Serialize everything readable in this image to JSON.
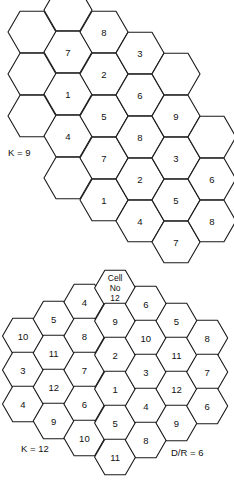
{
  "figure": {
    "background": "#ffffff",
    "stroke_color": "#1a1a1a",
    "text_color": "#111111"
  },
  "top_pattern": {
    "label": "K = 9",
    "label_pos": {
      "x": 8,
      "y": 147
    },
    "hex_radius": 24,
    "origin": {
      "x": 32,
      "y": 32
    },
    "col_spacing": 36,
    "row_spacing": 42,
    "cells": [
      {
        "col": 0,
        "y": 32,
        "text": ""
      },
      {
        "col": 0,
        "y": 74,
        "text": ""
      },
      {
        "col": 0,
        "y": 116,
        "text": ""
      },
      {
        "col": 1,
        "y": 10,
        "text": ""
      },
      {
        "col": 1,
        "y": 52,
        "text": "7"
      },
      {
        "col": 1,
        "y": 94,
        "text": "1"
      },
      {
        "col": 1,
        "y": 136,
        "text": "4"
      },
      {
        "col": 1,
        "y": 178,
        "text": ""
      },
      {
        "col": 2,
        "y": 32,
        "text": "8"
      },
      {
        "col": 2,
        "y": 74,
        "text": "2"
      },
      {
        "col": 2,
        "y": 116,
        "text": "5"
      },
      {
        "col": 2,
        "y": 158,
        "text": "7"
      },
      {
        "col": 2,
        "y": 200,
        "text": "1"
      },
      {
        "col": 3,
        "y": 53,
        "text": "3"
      },
      {
        "col": 3,
        "y": 95,
        "text": "6"
      },
      {
        "col": 3,
        "y": 137,
        "text": "8"
      },
      {
        "col": 3,
        "y": 179,
        "text": "2"
      },
      {
        "col": 3,
        "y": 221,
        "text": "4"
      },
      {
        "col": 4,
        "y": 74,
        "text": ""
      },
      {
        "col": 4,
        "y": 116,
        "text": "9"
      },
      {
        "col": 4,
        "y": 158,
        "text": "3"
      },
      {
        "col": 4,
        "y": 200,
        "text": "5"
      },
      {
        "col": 4,
        "y": 242,
        "text": "7"
      },
      {
        "col": 5,
        "y": 137,
        "text": ""
      },
      {
        "col": 5,
        "y": 179,
        "text": "6"
      },
      {
        "col": 5,
        "y": 221,
        "text": "8"
      }
    ]
  },
  "bottom_pattern": {
    "label": "K = 12",
    "label_pos": {
      "x": 21,
      "y": 443
    },
    "ratio_label": "D/R = 6",
    "ratio_label_pos": {
      "x": 171,
      "y": 447
    },
    "hex_radius": 20.5,
    "origin": {
      "x": 23,
      "y": 0
    },
    "col_spacing": 30.7,
    "cells": [
      {
        "col": 0,
        "y": 336,
        "text": "10"
      },
      {
        "col": 0,
        "y": 370,
        "text": "3"
      },
      {
        "col": 0,
        "y": 404,
        "text": "4"
      },
      {
        "col": 1,
        "y": 319,
        "text": "5"
      },
      {
        "col": 1,
        "y": 353,
        "text": "11"
      },
      {
        "col": 1,
        "y": 387,
        "text": "12"
      },
      {
        "col": 1,
        "y": 421,
        "text": "9"
      },
      {
        "col": 2,
        "y": 302,
        "text": "4"
      },
      {
        "col": 2,
        "y": 336,
        "text": "8"
      },
      {
        "col": 2,
        "y": 370,
        "text": "7"
      },
      {
        "col": 2,
        "y": 404,
        "text": "6"
      },
      {
        "col": 2,
        "y": 438,
        "text": "10"
      },
      {
        "col": 3,
        "y": 288,
        "text": "Cell|No|12"
      },
      {
        "col": 3,
        "y": 321,
        "text": "9"
      },
      {
        "col": 3,
        "y": 355,
        "text": "2"
      },
      {
        "col": 3,
        "y": 389,
        "text": "1"
      },
      {
        "col": 3,
        "y": 423,
        "text": "5"
      },
      {
        "col": 3,
        "y": 457,
        "text": "11"
      },
      {
        "col": 4,
        "y": 304,
        "text": "6"
      },
      {
        "col": 4,
        "y": 338,
        "text": "10"
      },
      {
        "col": 4,
        "y": 372,
        "text": "3"
      },
      {
        "col": 4,
        "y": 406,
        "text": "4"
      },
      {
        "col": 4,
        "y": 440,
        "text": "8"
      },
      {
        "col": 5,
        "y": 321,
        "text": "5"
      },
      {
        "col": 5,
        "y": 355,
        "text": "11"
      },
      {
        "col": 5,
        "y": 389,
        "text": "12"
      },
      {
        "col": 5,
        "y": 423,
        "text": "9"
      },
      {
        "col": 6,
        "y": 338,
        "text": "8"
      },
      {
        "col": 6,
        "y": 372,
        "text": "7"
      },
      {
        "col": 6,
        "y": 406,
        "text": "6"
      }
    ]
  }
}
